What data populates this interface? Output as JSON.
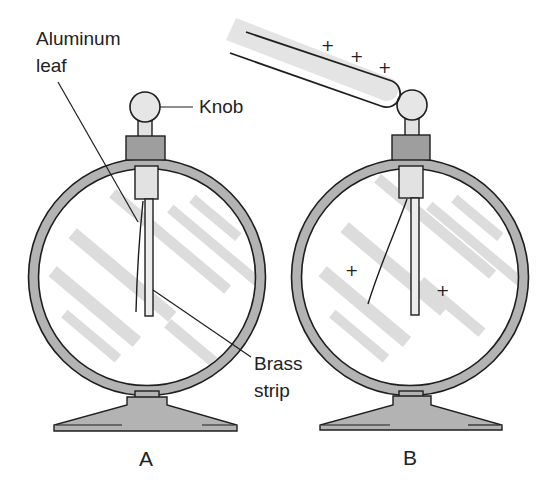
{
  "diagram": {
    "type": "electroscope-comparison",
    "colors": {
      "ring": "#b3b3b3",
      "collar": "#9e9e9e",
      "tube": "#e2e2e2",
      "knob": "#e6e6e6",
      "glare": "#dcdcdc",
      "outline": "#1e1e1e",
      "rod": "#e4e4e4"
    },
    "labels": {
      "aluminum_leaf_line1": "Aluminum",
      "aluminum_leaf_line2": "leaf",
      "knob": "Knob",
      "brass_strip_line1": "Brass",
      "brass_strip_line2": "strip"
    },
    "panels": [
      {
        "id": "A",
        "caption": "A",
        "state": "uncharged",
        "leaf": "hanging against strip"
      },
      {
        "id": "B",
        "caption": "B",
        "state": "charged by positive rod",
        "leaf": "diverged from strip"
      }
    ],
    "charges": {
      "rod_signs": [
        "+",
        "+",
        "+"
      ],
      "inside_signs": [
        "+",
        "+"
      ]
    }
  }
}
